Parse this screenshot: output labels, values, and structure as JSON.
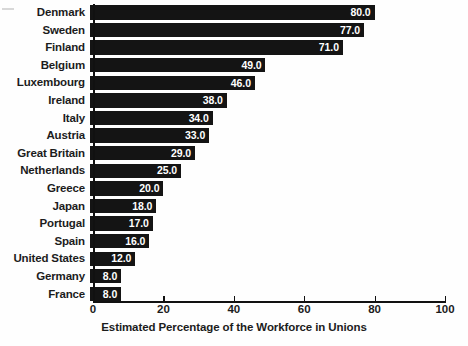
{
  "chart_data": {
    "type": "bar",
    "orientation": "horizontal",
    "title": "",
    "xlabel": "Estimated Percentage of the Workforce in Unions",
    "ylabel": "",
    "xlim": [
      0,
      100
    ],
    "xticks": [
      "0",
      "20",
      "40",
      "60",
      "80",
      "100"
    ],
    "grid": false,
    "legend": null,
    "bar_color": "#141414",
    "value_label_color": "#ffffff",
    "categories": [
      "Denmark",
      "Sweden",
      "Finland",
      "Belgium",
      "Luxembourg",
      "Ireland",
      "Italy",
      "Austria",
      "Great Britain",
      "Netherlands",
      "Greece",
      "Japan",
      "Portugal",
      "Spain",
      "United States",
      "Germany",
      "France"
    ],
    "values": [
      80.0,
      77.0,
      71.0,
      49.0,
      46.0,
      38.0,
      34.0,
      33.0,
      29.0,
      25.0,
      20.0,
      18.0,
      17.0,
      16.0,
      12.0,
      8.0,
      8.0
    ],
    "value_labels": [
      "80.0",
      "77.0",
      "71.0",
      "49.0",
      "46.0",
      "38.0",
      "34.0",
      "33.0",
      "29.0",
      "25.0",
      "20.0",
      "18.0",
      "17.0",
      "16.0",
      "12.0",
      "8.0",
      "8.0"
    ]
  }
}
